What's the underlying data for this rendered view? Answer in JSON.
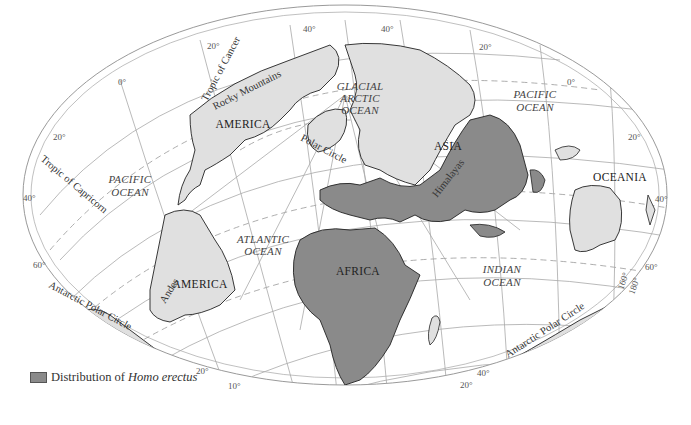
{
  "map": {
    "title": "Distribution of Homo erectus",
    "projection": "oblique elliptical",
    "colors": {
      "background": "#ffffff",
      "land": "#e0e0e0",
      "homo_erectus_range": "#8a8a8a",
      "graticule": "#9a9a9a",
      "coastline": "#222222"
    },
    "continents": {
      "north_america": "AMERICA",
      "south_america": "AMERICA",
      "asia": "ASIA",
      "africa": "AFRICA",
      "oceania": "OCEANIA"
    },
    "oceans": {
      "arctic_line1": "GLACIAL",
      "arctic_line2": "ARCTIC",
      "arctic_line3": "OCEAN",
      "pacific_west_line1": "PACIFIC",
      "pacific_west_line2": "OCEAN",
      "pacific_east_line1": "PACIFIC",
      "pacific_east_line2": "OCEAN",
      "atlantic_line1": "ATLANTIC",
      "atlantic_line2": "OCEAN",
      "indian_line1": "INDIAN",
      "indian_line2": "OCEAN"
    },
    "features": {
      "rocky_mountains": "Rocky Mountains",
      "andes": "Andes",
      "himalayas": "Himalayas",
      "tropic_of_cancer": "Tropic of Cancer",
      "tropic_of_capricorn": "Tropic of Capricorn",
      "polar_circle": "Polar Circle",
      "antarctic_polar_circle_west": "Antarctic Polar Circle",
      "antarctic_polar_circle_east": "Antarctic Polar Circle"
    },
    "degree_labels": {
      "top_40_left": "40°",
      "top_40_right": "40°",
      "top_20_left": "20°",
      "top_20_right": "20°",
      "zero_left": "0°",
      "zero_right": "0°",
      "left_20": "20°",
      "left_40": "40°",
      "left_60": "60°",
      "right_20": "20°",
      "right_40": "40°",
      "right_60": "60°",
      "right_160": "160°",
      "right_180": "180°",
      "bottom_20_left": "20°",
      "bottom_10_left": "10°",
      "bottom_40_right": "40°",
      "bottom_20_right": "20°"
    }
  },
  "legend": {
    "prefix": "Distribution of ",
    "species": "Homo erectus"
  }
}
